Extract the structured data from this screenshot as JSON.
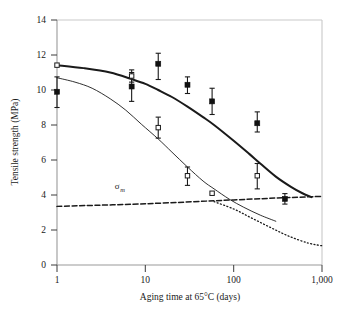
{
  "chart_data": {
    "type": "scatter",
    "title": "",
    "xlabel": "Aging time at 65°C (days)",
    "ylabel": "Tensile strength (MPa)",
    "xscale": "log",
    "xlim": [
      1,
      1000
    ],
    "ylim": [
      0,
      14
    ],
    "xticks": [
      1,
      10,
      100,
      1000
    ],
    "xtick_labels": [
      "1",
      "10",
      "100",
      "1,000"
    ],
    "yticks": [
      0,
      2,
      4,
      6,
      8,
      10,
      12,
      14
    ],
    "ytick_labels": [
      "0",
      "2",
      "4",
      "6",
      "8",
      "10",
      "12",
      "14"
    ],
    "grid": false,
    "legend": "none",
    "series": [
      {
        "name": "filled-squares",
        "marker": "filled-square",
        "points": [
          {
            "x": 1,
            "y": 9.9,
            "err_low": 0.9,
            "err_high": 0.85
          },
          {
            "x": 7,
            "y": 10.2,
            "err_low": 0.85,
            "err_high": 0.8
          },
          {
            "x": 14,
            "y": 11.5,
            "err_low": 0.9,
            "err_high": 0.6
          },
          {
            "x": 30,
            "y": 10.3,
            "err_low": 0.5,
            "err_high": 0.45
          },
          {
            "x": 57,
            "y": 9.35,
            "err_low": 0.75,
            "err_high": 0.75
          },
          {
            "x": 185,
            "y": 8.1,
            "err_low": 0.5,
            "err_high": 0.65
          },
          {
            "x": 380,
            "y": 3.78,
            "err_low": 0.3,
            "err_high": 0.3
          }
        ]
      },
      {
        "name": "open-squares",
        "marker": "open-square",
        "points": [
          {
            "x": 1,
            "y": 11.42,
            "err_low": 0.0,
            "err_high": 0.0
          },
          {
            "x": 7,
            "y": 10.8,
            "err_low": 0.35,
            "err_high": 0.35
          },
          {
            "x": 14,
            "y": 7.85,
            "err_low": 0.6,
            "err_high": 0.6
          },
          {
            "x": 30,
            "y": 5.1,
            "err_low": 0.55,
            "err_high": 0.5
          },
          {
            "x": 57,
            "y": 4.1,
            "err_low": 0.0,
            "err_high": 0.0
          },
          {
            "x": 185,
            "y": 5.1,
            "err_low": 0.75,
            "err_high": 0.7
          }
        ]
      }
    ],
    "curves": [
      {
        "name": "upper-fit-curve",
        "style": "solid-thick",
        "points": [
          [
            1,
            11.42
          ],
          [
            2,
            11.25
          ],
          [
            4,
            11.0
          ],
          [
            7,
            10.62
          ],
          [
            10,
            10.35
          ],
          [
            14,
            10.0
          ],
          [
            20,
            9.6
          ],
          [
            30,
            9.05
          ],
          [
            45,
            8.45
          ],
          [
            60,
            8.0
          ],
          [
            100,
            7.1
          ],
          [
            150,
            6.35
          ],
          [
            200,
            5.8
          ],
          [
            300,
            5.05
          ],
          [
            450,
            4.45
          ],
          [
            600,
            4.1
          ],
          [
            760,
            3.88
          ]
        ]
      },
      {
        "name": "lower-fit-curve",
        "style": "solid-thin",
        "points": [
          [
            1,
            10.7
          ],
          [
            1.6,
            10.45
          ],
          [
            2.5,
            10.1
          ],
          [
            4,
            9.5
          ],
          [
            6,
            8.85
          ],
          [
            9,
            8.05
          ],
          [
            14,
            7.2
          ],
          [
            20,
            6.45
          ],
          [
            30,
            5.6
          ],
          [
            45,
            4.8
          ],
          [
            60,
            4.35
          ],
          [
            90,
            3.75
          ],
          [
            130,
            3.3
          ],
          [
            200,
            2.85
          ],
          [
            300,
            2.5
          ]
        ]
      },
      {
        "name": "sigma-m-dashed-line",
        "style": "dashed",
        "points": [
          [
            1,
            3.35
          ],
          [
            10,
            3.5
          ],
          [
            100,
            3.72
          ],
          [
            400,
            3.85
          ],
          [
            1000,
            3.92
          ]
        ]
      },
      {
        "name": "sigma-m-dotted-branch",
        "style": "dotted",
        "points": [
          [
            60,
            3.62
          ],
          [
            100,
            3.2
          ],
          [
            160,
            2.68
          ],
          [
            260,
            2.15
          ],
          [
            420,
            1.65
          ],
          [
            700,
            1.25
          ],
          [
            1000,
            1.1
          ]
        ]
      }
    ],
    "annotations": [
      {
        "name": "sigma-m",
        "text": "σ",
        "subscript": "m",
        "x": 4.5,
        "y": 4.32
      }
    ]
  },
  "axes": {
    "y_title": "Tensile strength (MPa)",
    "x_title": "Aging time at 65°C (days)",
    "x_ticks": [
      "1",
      "10",
      "100",
      "1,000"
    ],
    "y_ticks": [
      "0",
      "2",
      "4",
      "6",
      "8",
      "10",
      "12",
      "14"
    ]
  },
  "colors": {
    "frame": "#c9c9c9",
    "ink": "#1a1a1a",
    "marker_fill": "#111111",
    "marker_open": "#ffffff"
  }
}
